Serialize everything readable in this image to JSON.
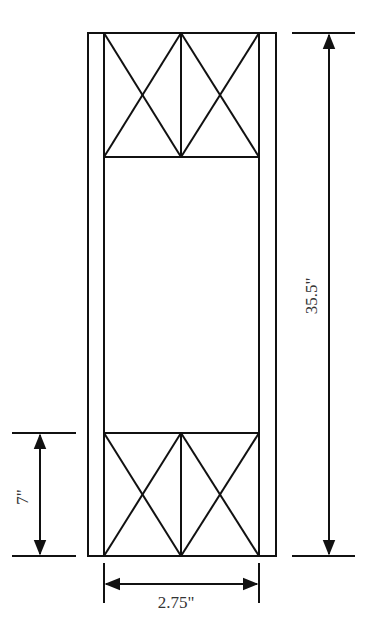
{
  "diagram": {
    "type": "frame elevation with dimensions",
    "colors": {
      "line": "#111111",
      "background": "#ffffff",
      "text": "#333333"
    },
    "dimensions": {
      "height": {
        "label": "35.5\""
      },
      "width": {
        "label": "2.75\""
      },
      "panel_height": {
        "label": "7\""
      }
    },
    "panels": [
      {
        "position": "top",
        "bracing": "double X-brace"
      },
      {
        "position": "middle",
        "bracing": "open"
      },
      {
        "position": "bottom",
        "bracing": "double X-brace"
      }
    ]
  }
}
